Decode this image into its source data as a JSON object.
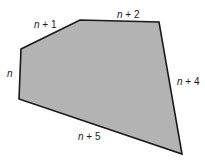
{
  "figure": {
    "shape": "pentagon",
    "fill_color": "#b3b3b3",
    "stroke_color": "#1a1a1a",
    "vertices": [
      [
        21,
        49
      ],
      [
        80,
        20
      ],
      [
        159,
        22
      ],
      [
        182,
        154
      ],
      [
        19,
        99
      ]
    ],
    "sides": [
      {
        "label_var": "n",
        "label_rest": " + 1",
        "x": 34,
        "y": 28
      },
      {
        "label_var": "n",
        "label_rest": " + 2",
        "x": 117,
        "y": 18
      },
      {
        "label_var": "n",
        "label_rest": " + 4",
        "x": 177,
        "y": 85
      },
      {
        "label_var": "n",
        "label_rest": " + 5",
        "x": 78,
        "y": 140
      },
      {
        "label_var": "n",
        "label_rest": "",
        "x": 7,
        "y": 77
      }
    ]
  }
}
